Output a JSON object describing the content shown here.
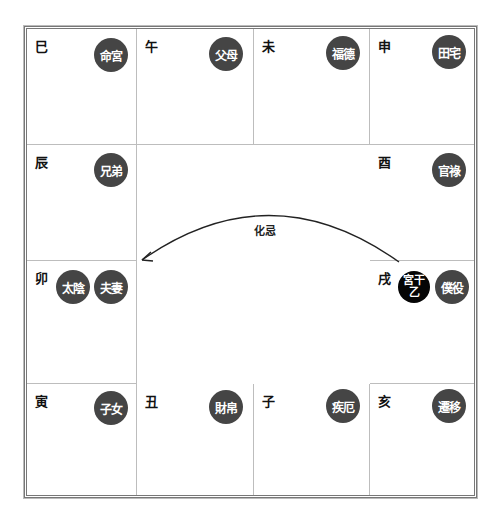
{
  "chart": {
    "cells": [
      {
        "branch": "巳",
        "palace": "命宮"
      },
      {
        "branch": "午",
        "palace": "父母"
      },
      {
        "branch": "未",
        "palace": "福德"
      },
      {
        "branch": "申",
        "palace": "田宅"
      },
      {
        "branch": "辰",
        "palace": "兄弟"
      },
      {
        "branch": "酉",
        "palace": "官祿"
      },
      {
        "branch": "卯",
        "palace": "夫妻",
        "star": "太陰"
      },
      {
        "branch": "戌",
        "palace": "僕役",
        "stem_label": "宮干",
        "stem_value": "乙"
      },
      {
        "branch": "寅",
        "palace": "子女"
      },
      {
        "branch": "丑",
        "palace": "財帛"
      },
      {
        "branch": "子",
        "palace": "疾厄"
      },
      {
        "branch": "亥",
        "palace": "遷移"
      }
    ],
    "transformation": {
      "label": "化忌",
      "from_branch": "戌",
      "to_branch": "卯"
    }
  },
  "colors": {
    "palace_circle": "#454545",
    "stem_circle": "#050505",
    "grid_line": "#bdbdbd",
    "frame": "#777777"
  }
}
